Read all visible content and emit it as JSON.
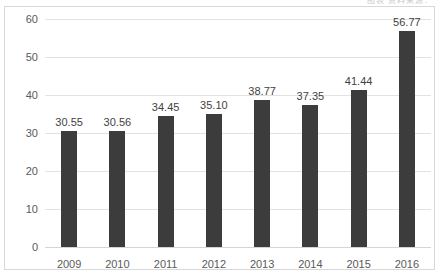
{
  "top_caption": "图表 资料来源：",
  "colors": {
    "bar": "#3c3c3c",
    "gridline": "#e2e2e2",
    "frame": "#d8d8d8",
    "axis_text": "#5a5a5a",
    "label_text": "#3f3f3f"
  },
  "chart_data": {
    "type": "bar",
    "title": "",
    "subtitle": "",
    "xlabel": "",
    "ylabel": "",
    "categories": [
      "2009",
      "2010",
      "2011",
      "2012",
      "2013",
      "2014",
      "2015",
      "2016"
    ],
    "values": [
      30.55,
      30.56,
      34.45,
      35.1,
      38.77,
      37.35,
      41.44,
      56.77
    ],
    "data_labels": [
      "30.55",
      "30.56",
      "34.45",
      "35.10",
      "38.77",
      "37.35",
      "41.44",
      "56.77"
    ],
    "series": [
      {
        "name": "",
        "values": [
          30.55,
          30.56,
          34.45,
          35.1,
          38.77,
          37.35,
          41.44,
          56.77
        ]
      }
    ],
    "ylim": [
      0,
      60
    ],
    "yticks": [
      0,
      10,
      20,
      30,
      40,
      50,
      60
    ],
    "ytick_labels": [
      "0",
      "10",
      "20",
      "30",
      "40",
      "50",
      "60"
    ],
    "ytick_interval": 10,
    "grid": true,
    "grid_axis": "y",
    "legend": false,
    "legend_position": "none",
    "bar_color": "#3c3c3c"
  }
}
